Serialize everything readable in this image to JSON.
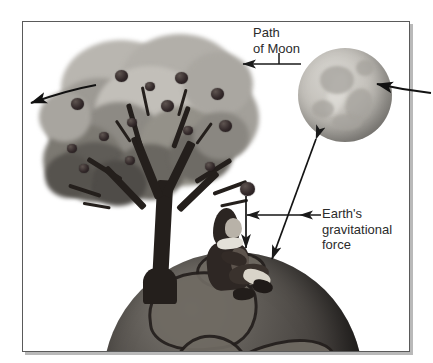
{
  "figure": {
    "domain": "Diagram",
    "title_visible": false,
    "frame": {
      "border_color": "#5a5a5a",
      "shadow_color": "#b9b9b9",
      "background": "#ffffff"
    },
    "labels": [
      {
        "id": "path-of-moon",
        "text": "Path\nof Moon",
        "lines": [
          "Path",
          "of Moon"
        ],
        "color": "#2b2b2b",
        "font_size_px": 13,
        "position": {
          "x": 253,
          "y": 25
        },
        "leader": "vertical stem down to horizontal arrow pointing left"
      },
      {
        "id": "earths-gravitational-force",
        "text": "Earth's\ngravitational\nforce",
        "lines": [
          "Earth's",
          "gravitational",
          "force"
        ],
        "color": "#2b2b2b",
        "font_size_px": 13,
        "position": {
          "x": 322,
          "y": 206
        },
        "leader": "horizontal line left to double headed arrow"
      }
    ],
    "objects": [
      {
        "id": "moon",
        "name": "moon",
        "shape": "circle",
        "center": {
          "x": 322,
          "y": 73
        },
        "radius_px": 47,
        "fill": "#c4c1bb",
        "description": "grey cratered full moon"
      },
      {
        "id": "earth",
        "name": "earth",
        "shape": "circle",
        "center": {
          "x": 233,
          "y": 382
        },
        "radius_px": 130,
        "fill": "#413d3a",
        "description": "dark globe with continents, clipped by frame bottom"
      },
      {
        "id": "apple-tree",
        "name": "apple-tree",
        "description": "grey leafy canopy with dark apples and dark branching trunk"
      },
      {
        "id": "newton",
        "name": "newton-figure",
        "description": "seated man with long hair, dark coat, light stockings, leaning on trunk"
      },
      {
        "id": "falling-apple",
        "name": "falling-apple",
        "center": {
          "x": 246,
          "y": 188
        },
        "description": "single apple falling from the tree"
      }
    ],
    "arrows": [
      {
        "id": "moon-path-left",
        "name": "moon-path-arrow-left",
        "from": {
          "x": 95,
          "y": 86
        },
        "to": {
          "x": 30,
          "y": 103
        },
        "heads": "end",
        "meaning": "path of Moon continuing off frame to the left"
      },
      {
        "id": "moon-path-right",
        "name": "moon-path-arrow-right",
        "from": {
          "x": 430,
          "y": 92
        },
        "to": {
          "x": 376,
          "y": 84
        },
        "heads": "end",
        "meaning": "path of Moon arriving from the right"
      },
      {
        "id": "path-of-moon-leader",
        "name": "path-of-moon-leader-arrow",
        "from": {
          "x": 300,
          "y": 64
        },
        "to": {
          "x": 242,
          "y": 64
        },
        "heads": "end",
        "meaning": "label leader pointing to the Moon's orbital path"
      },
      {
        "id": "apple-fall",
        "name": "falling-apple-arrow",
        "from": {
          "x": 246,
          "y": 196
        },
        "to": {
          "x": 246,
          "y": 248
        },
        "heads": "end",
        "meaning": "apple falls toward the Earth"
      },
      {
        "id": "force-horizontal",
        "name": "gravitational-force-double-arrow",
        "from": {
          "x": 247,
          "y": 215
        },
        "to": {
          "x": 300,
          "y": 215
        },
        "heads": "both",
        "meaning": "Earth's gravitational force on the apple"
      },
      {
        "id": "force-to-moon",
        "name": "gravitational-force-moon-arrow",
        "from": {
          "x": 316,
          "y": 140
        },
        "to": {
          "x": 272,
          "y": 258
        },
        "heads": "both",
        "meaning": "Earth's gravitational force acting on the Moon"
      }
    ],
    "apples_in_tree": [
      {
        "x": 92,
        "y": 68
      },
      {
        "x": 142,
        "y": 70
      },
      {
        "x": 176,
        "y": 86
      },
      {
        "x": 63,
        "y": 94
      },
      {
        "x": 133,
        "y": 95
      },
      {
        "x": 98,
        "y": 112
      },
      {
        "x": 183,
        "y": 115
      },
      {
        "x": 58,
        "y": 134
      },
      {
        "x": 70,
        "y": 150
      },
      {
        "x": 110,
        "y": 143
      },
      {
        "x": 152,
        "y": 120
      },
      {
        "x": 120,
        "y": 80
      }
    ]
  }
}
